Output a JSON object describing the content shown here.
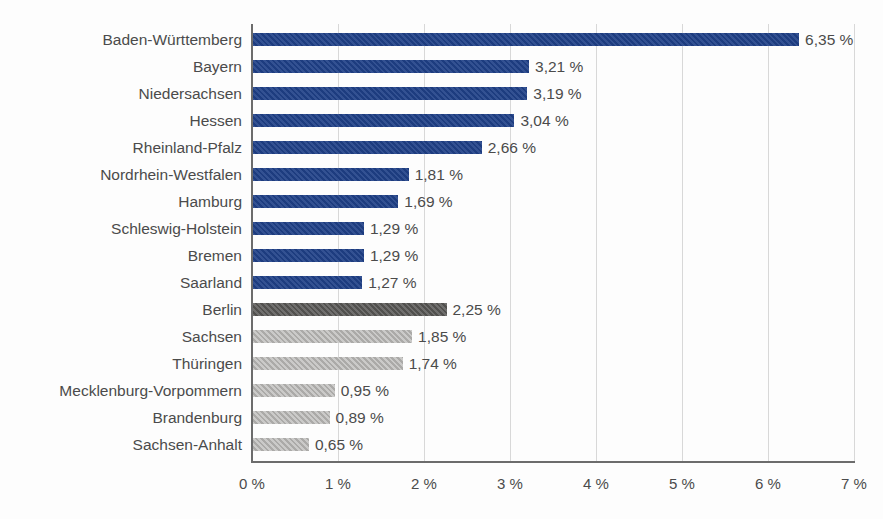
{
  "chart_data": {
    "type": "bar",
    "orientation": "horizontal",
    "title": "",
    "subtitle": "",
    "xlabel": "",
    "ylabel": "",
    "xlim": [
      0,
      7
    ],
    "xticks": [
      0,
      1,
      2,
      3,
      4,
      5,
      6,
      7
    ],
    "xtick_labels": [
      "0 %",
      "1 %",
      "2 %",
      "3 %",
      "4 %",
      "5 %",
      "6 %",
      "7 %"
    ],
    "grid": true,
    "grid_axis": "x",
    "legend": "none",
    "value_label_suffix": " %",
    "decimal_separator": ",",
    "categories": [
      "Baden-Württemberg",
      "Bayern",
      "Niedersachsen",
      "Hessen",
      "Rheinland-Pfalz",
      "Nordrhein-Westfalen",
      "Hamburg",
      "Schleswig-Holstein",
      "Bremen",
      "Saarland",
      "Berlin",
      "Sachsen",
      "Thüringen",
      "Mecklenburg-Vorpommern",
      "Brandenburg",
      "Sachsen-Anhalt"
    ],
    "values": [
      6.35,
      3.21,
      3.19,
      3.04,
      2.66,
      1.81,
      1.69,
      1.29,
      1.29,
      1.27,
      2.25,
      1.85,
      1.74,
      0.95,
      0.89,
      0.65
    ],
    "value_labels": [
      "6,35 %",
      "3,21 %",
      "3,19 %",
      "3,04 %",
      "2,66 %",
      "1,81 %",
      "1,69 %",
      "1,29 %",
      "1,29 %",
      "1,27 %",
      "2,25 %",
      "1,85 %",
      "1,74 %",
      "0,95 %",
      "0,89 %",
      "0,65 %"
    ],
    "bar_groups": [
      {
        "name": "west",
        "color": "#1f4087",
        "indices": [
          0,
          1,
          2,
          3,
          4,
          5,
          6,
          7,
          8,
          9
        ]
      },
      {
        "name": "berlin",
        "color": "#555452",
        "indices": [
          10
        ]
      },
      {
        "name": "east",
        "color": "#b4b3b1",
        "indices": [
          11,
          12,
          13,
          14,
          15
        ]
      }
    ],
    "bars": [
      {
        "label": "Baden-Württemberg",
        "value": 6.35,
        "value_label": "6,35 %",
        "color": "#1f4087",
        "group": "west"
      },
      {
        "label": "Bayern",
        "value": 3.21,
        "value_label": "3,21 %",
        "color": "#1f4087",
        "group": "west"
      },
      {
        "label": "Niedersachsen",
        "value": 3.19,
        "value_label": "3,19 %",
        "color": "#1f4087",
        "group": "west"
      },
      {
        "label": "Hessen",
        "value": 3.04,
        "value_label": "3,04 %",
        "color": "#1f4087",
        "group": "west"
      },
      {
        "label": "Rheinland-Pfalz",
        "value": 2.66,
        "value_label": "2,66 %",
        "color": "#1f4087",
        "group": "west"
      },
      {
        "label": "Nordrhein-Westfalen",
        "value": 1.81,
        "value_label": "1,81 %",
        "color": "#1f4087",
        "group": "west"
      },
      {
        "label": "Hamburg",
        "value": 1.69,
        "value_label": "1,69 %",
        "color": "#1f4087",
        "group": "west"
      },
      {
        "label": "Schleswig-Holstein",
        "value": 1.29,
        "value_label": "1,29 %",
        "color": "#1f4087",
        "group": "west"
      },
      {
        "label": "Bremen",
        "value": 1.29,
        "value_label": "1,29 %",
        "color": "#1f4087",
        "group": "west"
      },
      {
        "label": "Saarland",
        "value": 1.27,
        "value_label": "1,27 %",
        "color": "#1f4087",
        "group": "west"
      },
      {
        "label": "Berlin",
        "value": 2.25,
        "value_label": "2,25 %",
        "color": "#555452",
        "group": "berlin"
      },
      {
        "label": "Sachsen",
        "value": 1.85,
        "value_label": "1,85 %",
        "color": "#b4b3b1",
        "group": "east"
      },
      {
        "label": "Thüringen",
        "value": 1.74,
        "value_label": "1,74 %",
        "color": "#b4b3b1",
        "group": "east"
      },
      {
        "label": "Mecklenburg-Vorpommern",
        "value": 0.95,
        "value_label": "0,95 %",
        "color": "#b4b3b1",
        "group": "east"
      },
      {
        "label": "Brandenburg",
        "value": 0.89,
        "value_label": "0,89 %",
        "color": "#b4b3b1",
        "group": "east"
      },
      {
        "label": "Sachsen-Anhalt",
        "value": 0.65,
        "value_label": "0,65 %",
        "color": "#b4b3b1",
        "group": "east"
      }
    ],
    "colors": {
      "bar_blue": "#1f4087",
      "bar_dark_gray": "#555452",
      "bar_light_gray": "#b4b3b1",
      "text": "#4b4b4b",
      "axis": "#6c6c6c",
      "gridline": "#d8d8d8",
      "background": "#fdfdfd"
    }
  }
}
